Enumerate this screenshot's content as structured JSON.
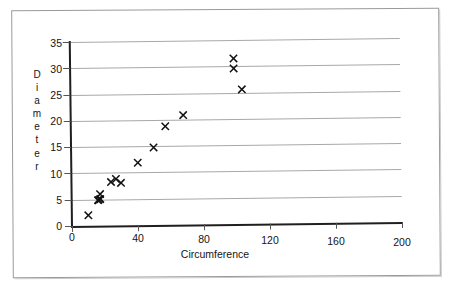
{
  "chart_data": {
    "type": "scatter",
    "title": "",
    "xlabel": "Circumference",
    "ylabel": "Diameter",
    "xlim": [
      0,
      200
    ],
    "ylim": [
      0,
      35
    ],
    "xticks": [
      0,
      40,
      80,
      120,
      160,
      200
    ],
    "yticks": [
      0,
      5,
      10,
      15,
      20,
      25,
      30,
      35
    ],
    "grid": "horizontal",
    "legend": "none",
    "marker": "x",
    "marker_color": "#111111",
    "gridline_color": "#a8a8a8",
    "axis_color": "#1f1f1f",
    "series": [
      {
        "name": "Diameter vs Circumference",
        "points": [
          {
            "x": 10,
            "y": 2,
            "emphasis": "normal"
          },
          {
            "x": 16,
            "y": 4.8,
            "emphasis": "bold"
          },
          {
            "x": 17,
            "y": 5.1,
            "emphasis": "bold"
          },
          {
            "x": 17,
            "y": 5.9,
            "emphasis": "normal"
          },
          {
            "x": 24,
            "y": 8.2,
            "emphasis": "normal"
          },
          {
            "x": 27,
            "y": 8.8,
            "emphasis": "normal"
          },
          {
            "x": 30,
            "y": 8.0,
            "emphasis": "normal"
          },
          {
            "x": 40,
            "y": 11.8,
            "emphasis": "normal"
          },
          {
            "x": 50,
            "y": 14.8,
            "emphasis": "normal"
          },
          {
            "x": 57,
            "y": 18.8,
            "emphasis": "normal"
          },
          {
            "x": 68,
            "y": 20.8,
            "emphasis": "normal"
          },
          {
            "x": 99,
            "y": 31.5,
            "emphasis": "normal"
          },
          {
            "x": 99,
            "y": 29.5,
            "emphasis": "normal"
          },
          {
            "x": 104,
            "y": 25.6,
            "emphasis": "normal"
          }
        ]
      }
    ]
  },
  "axis": {
    "y_title_letters": [
      "D",
      "i",
      "a",
      "m",
      "e",
      "t",
      "e",
      "r"
    ],
    "x_title": "Circumference",
    "x_tick_labels": [
      "0",
      "40",
      "80",
      "120",
      "160",
      "200"
    ],
    "y_tick_labels": [
      "0",
      "5",
      "10",
      "15",
      "20",
      "25",
      "30",
      "35"
    ]
  }
}
